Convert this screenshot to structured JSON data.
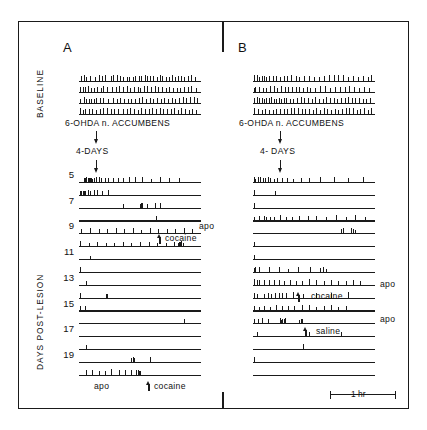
{
  "figure": {
    "type": "event-record-actogram",
    "background": "#ffffff",
    "ink_color": "#1a1a1a"
  },
  "axis_labels": {
    "baseline": "BASELINE",
    "post_lesion": "DAYS  POST-LESION"
  },
  "scalebar": {
    "label": "1 hr",
    "left_cap": "|",
    "right_cap": "|"
  },
  "panels": [
    {
      "id": "A",
      "letter": "A",
      "treatment_label": "6-OHDA   n. ACCUMBENS",
      "interval_label": "4-DAYS",
      "treatment_arrow": "arrow-down",
      "interval_arrow": "arrow-down",
      "day_labels": [
        "5",
        "7",
        "9",
        "11",
        "13",
        "15",
        "17",
        "19"
      ],
      "annotations": [
        {
          "text": "apo",
          "kind": "label-right",
          "row": 8
        },
        {
          "text": "cocaine",
          "kind": "label-inline-arrow",
          "row": 9
        },
        {
          "text": "apo",
          "kind": "label-below",
          "row": 23
        },
        {
          "text": "cocaine",
          "kind": "label-below-arrow",
          "row": 23
        }
      ],
      "baseline_rows": 4,
      "postlesion_rows": 16
    },
    {
      "id": "B",
      "letter": "B",
      "treatment_label": "6-OHDA   n. ACCUMBENS",
      "interval_label": "4- DAYS",
      "treatment_arrow": "arrow-down",
      "interval_arrow": "arrow-down",
      "day_labels": [],
      "annotations": [
        {
          "text": "apo",
          "kind": "label-right",
          "row": 11
        },
        {
          "text": "cocaine",
          "kind": "label-inline-arrow",
          "row": 12
        },
        {
          "text": "apo",
          "kind": "label-right",
          "row": 14
        },
        {
          "text": "saline",
          "kind": "label-inline-arrow",
          "row": 15
        }
      ],
      "baseline_rows": 4,
      "postlesion_rows": 16
    }
  ],
  "chart_data": {
    "type": "event-record",
    "title": "",
    "xlabel": "Time (1 hr scale bar)",
    "ylabel": "DAYS  POST-LESION",
    "panel_A": {
      "baseline": [
        [
          2,
          4,
          6,
          9,
          13,
          16,
          19,
          21,
          26,
          28,
          31,
          34,
          36,
          39,
          41,
          44,
          46,
          49,
          51,
          54,
          56,
          58,
          61,
          64,
          66,
          68,
          71,
          74,
          76,
          79,
          81,
          84,
          86,
          89,
          92,
          95
        ],
        [
          1,
          3,
          5,
          7,
          10,
          12,
          15,
          18,
          20,
          23,
          27,
          30,
          33,
          36,
          39,
          42,
          45,
          48,
          50,
          53,
          56,
          59,
          62,
          65,
          68,
          71,
          74,
          77,
          80,
          83,
          86,
          89,
          92,
          96
        ],
        [
          1,
          4,
          6,
          8,
          10,
          12,
          14,
          17,
          20,
          24,
          28,
          31,
          34,
          37,
          40,
          43,
          46,
          49,
          52,
          55,
          58,
          61,
          64,
          67,
          70,
          73,
          76,
          79,
          82,
          85,
          88,
          91,
          94,
          97
        ],
        [
          1,
          3,
          5,
          8,
          11,
          14,
          17,
          20,
          23,
          26,
          29,
          32,
          36,
          39,
          42,
          45,
          48,
          51,
          54,
          57,
          60,
          63,
          66,
          69,
          72,
          75,
          78,
          81,
          84,
          87,
          90,
          93,
          96
        ]
      ],
      "post": [
        [
          4,
          5,
          6,
          7,
          8,
          9,
          10,
          11,
          12,
          14,
          16,
          18,
          21,
          24,
          28,
          32,
          36,
          41,
          46,
          52,
          59,
          66,
          74,
          82
        ],
        [
          1,
          2,
          3,
          4,
          5,
          7,
          9,
          12,
          15,
          19,
          24
        ],
        [
          36,
          50,
          51,
          52,
          56,
          62,
          66
        ],
        [
          63
        ],
        [
          2,
          9,
          16,
          23,
          30,
          37,
          44,
          51,
          58,
          65,
          72,
          79,
          86,
          93
        ],
        [
          1,
          8,
          15,
          22,
          29,
          36,
          43,
          50,
          57,
          64,
          71,
          78,
          81,
          82,
          83,
          84,
          85
        ],
        [
          9
        ],
        [
          1
        ],
        [
          6
        ],
        [
          1,
          22,
          23
        ],
        [
          1,
          5
        ],
        [
          86
        ],
        [],
        [
          6
        ],
        [
          43,
          44,
          45,
          58
        ],
        [
          6,
          11,
          16,
          21,
          26,
          33,
          38,
          43,
          47,
          48,
          49,
          50
        ]
      ]
    },
    "panel_B": {
      "baseline": [
        [
          1,
          3,
          5,
          7,
          9,
          11,
          13,
          16,
          19,
          22,
          25,
          28,
          31,
          35,
          38,
          42,
          46,
          50,
          54,
          58,
          62,
          66,
          70,
          74,
          78,
          82,
          86,
          90,
          94,
          97
        ],
        [
          1,
          2,
          5,
          8,
          11,
          14,
          17,
          20,
          23,
          26,
          29,
          32,
          35,
          38,
          41,
          44,
          47,
          51,
          55,
          59,
          63,
          67,
          71,
          75,
          79,
          83,
          87,
          91,
          95
        ],
        [
          1,
          3,
          5,
          7,
          9,
          11,
          13,
          15,
          17,
          19,
          21,
          23,
          25,
          27,
          30,
          33,
          36,
          39,
          42,
          45,
          48,
          51,
          54,
          57,
          60,
          63,
          66,
          69,
          72,
          75,
          78,
          81,
          84,
          87,
          90,
          93,
          96
        ],
        [
          1,
          4,
          7,
          10,
          13,
          16,
          19,
          22,
          25,
          28,
          31,
          34,
          37,
          40,
          43,
          46,
          49,
          52,
          55,
          58,
          61,
          64,
          67,
          70,
          73,
          76,
          79,
          82,
          85,
          88,
          91,
          94,
          97
        ]
      ],
      "post": [
        [
          1,
          2,
          4,
          6,
          8,
          10,
          12,
          14,
          17,
          20,
          24,
          28,
          33,
          39,
          46,
          55,
          66,
          78,
          90
        ],
        [
          1,
          18
        ],
        [
          1
        ],
        [
          1,
          5,
          9,
          11,
          14,
          17,
          22,
          27,
          32,
          38,
          45,
          52,
          60,
          68,
          76,
          84,
          92
        ],
        [
          72,
          74,
          80,
          82,
          84
        ],
        [
          1
        ],
        [
          1
        ],
        [
          1,
          2,
          5,
          13,
          21,
          29,
          37,
          47,
          55,
          57,
          60
        ],
        [
          1,
          3,
          5,
          9,
          13,
          17,
          21,
          25,
          30,
          35,
          40,
          46,
          52,
          58,
          64,
          70,
          76,
          82,
          88
        ],
        [
          1,
          3,
          9,
          12,
          15,
          18,
          21,
          24,
          27,
          33,
          41,
          52,
          64,
          78
        ],
        [
          1,
          5,
          9,
          14,
          19,
          24,
          29,
          34,
          40,
          46,
          52,
          58,
          64,
          70,
          76
        ],
        [
          1,
          4,
          7,
          12,
          22,
          23,
          24,
          25,
          26,
          38,
          39,
          40
        ],
        [
          3,
          46,
          72
        ],
        [
          41
        ],
        [
          1
        ],
        []
      ]
    }
  }
}
